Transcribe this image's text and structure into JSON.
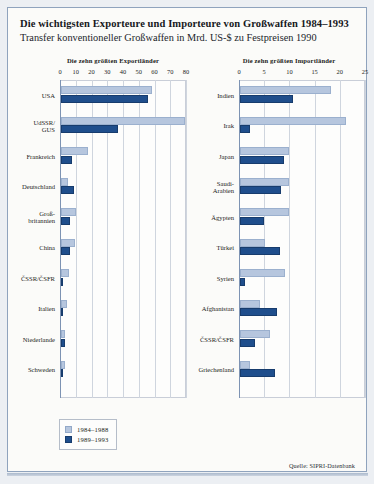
{
  "title": "Die wichtigsten Exporteure und Importeure von Großwaffen 1984–1993",
  "subtitle": "Transfer konventioneller Großwaffen in Mrd. US-$ zu Festpreisen 1990",
  "source": "Quelle: SIPRI-Datenbank",
  "legend": {
    "items": [
      {
        "label": "1984–1988",
        "color": "#b6c6de"
      },
      {
        "label": "1989–1993",
        "color": "#1f4e8c"
      }
    ]
  },
  "charts": [
    {
      "heading": "Die zehn größten Exportländer",
      "ticks": [
        "0",
        "10",
        "20",
        "30",
        "40",
        "50",
        "60",
        "70",
        "80"
      ]
    },
    {
      "heading": "Die zehn größten Importländer",
      "ticks": [
        "0",
        "5",
        "10",
        "15",
        "20",
        "25"
      ]
    }
  ],
  "chart_data": [
    {
      "type": "bar",
      "orientation": "horizontal",
      "title": "Die zehn größten Exportländer",
      "xlabel": "",
      "ylabel": "",
      "xlim": [
        0,
        80
      ],
      "xticks": [
        0,
        10,
        20,
        30,
        40,
        50,
        60,
        70,
        80
      ],
      "grid": true,
      "legend_position": "below-chart-left",
      "categories": [
        "USA",
        "UdSSR/\nGUS",
        "Frankreich",
        "Deutschland",
        "Groß-\nbritannien",
        "China",
        "ČSSR/ČSFR",
        "Italien",
        "Niederlande",
        "Schweden"
      ],
      "series": [
        {
          "name": "1984–1988",
          "color": "#b6c6de",
          "values": [
            58,
            79,
            17,
            4.5,
            9.5,
            9,
            5,
            4,
            2.5,
            2.5
          ]
        },
        {
          "name": "1989–1993",
          "color": "#1f4e8c",
          "values": [
            55,
            36,
            7,
            8,
            5.5,
            5.5,
            1.5,
            1.5,
            2.5,
            0.5
          ]
        }
      ]
    },
    {
      "type": "bar",
      "orientation": "horizontal",
      "title": "Die zehn größten Importländer",
      "xlabel": "",
      "ylabel": "",
      "xlim": [
        0,
        25
      ],
      "xticks": [
        0,
        5,
        10,
        15,
        20,
        25
      ],
      "grid": true,
      "legend_position": "below-chart-left",
      "categories": [
        "Indien",
        "Irak",
        "Japan",
        "Saudi-\nArabien",
        "Ägypten",
        "Türkei",
        "Syrien",
        "Afghanistan",
        "ČSSR/ČSFR",
        "Griechenland"
      ],
      "series": [
        {
          "name": "1984–1988",
          "color": "#b6c6de",
          "values": [
            18,
            21,
            9.7,
            9.8,
            9.8,
            5,
            9,
            4,
            6,
            2
          ]
        },
        {
          "name": "1989–1993",
          "color": "#1f4e8c",
          "values": [
            10.5,
            2,
            8.8,
            8.2,
            4.8,
            8,
            1,
            7.3,
            3,
            7
          ]
        }
      ]
    }
  ]
}
